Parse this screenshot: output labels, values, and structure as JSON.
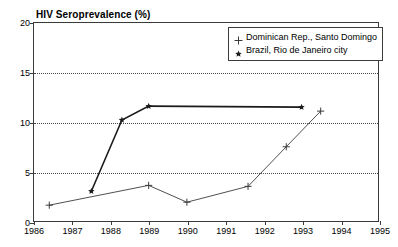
{
  "chart_data": {
    "type": "line",
    "title": "HIV Seroprevalence (%)",
    "xlabel": "",
    "ylabel": "HIV Seroprevalence (%)",
    "xlim": [
      1986,
      1995
    ],
    "ylim": [
      0,
      20
    ],
    "xticks": [
      "1986",
      "1987",
      "1988",
      "1989",
      "1990",
      "1991",
      "1992",
      "1993",
      "1994",
      "1995"
    ],
    "yticks": [
      "0",
      "5",
      "10",
      "15",
      "20"
    ],
    "grid": "horizontal-dotted",
    "legend_position": "top-right",
    "series": [
      {
        "name": "Dominican Rep., Santo Domingo",
        "marker": "plus",
        "color": "#3a3a3a",
        "points": [
          {
            "x": 1986.4,
            "y": 1.6
          },
          {
            "x": 1989.0,
            "y": 3.6
          },
          {
            "x": 1990.0,
            "y": 1.9
          },
          {
            "x": 1991.6,
            "y": 3.5
          },
          {
            "x": 1992.6,
            "y": 7.5
          },
          {
            "x": 1993.5,
            "y": 11.1
          }
        ]
      },
      {
        "name": "Brazil, Rio de Janeiro city",
        "marker": "star",
        "color": "#1a1a1a",
        "points": [
          {
            "x": 1987.5,
            "y": 3.0
          },
          {
            "x": 1988.3,
            "y": 10.2
          },
          {
            "x": 1989.0,
            "y": 11.6
          },
          {
            "x": 1993.0,
            "y": 11.5
          }
        ]
      }
    ]
  },
  "legend": {
    "entries": [
      {
        "label": "Dominican Rep., Santo Domingo",
        "marker": "plus"
      },
      {
        "label": "Brazil, Rio de Janeiro city",
        "marker": "star"
      }
    ]
  }
}
